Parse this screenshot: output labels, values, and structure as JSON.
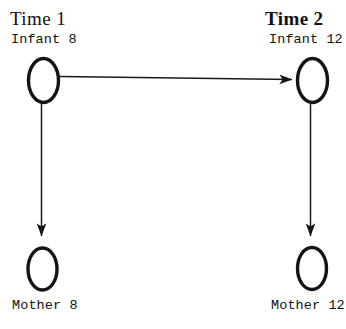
{
  "diagram": {
    "type": "path-diagram",
    "background_color": "#ffffff",
    "stroke_color": "#141414",
    "columns": [
      {
        "id": "time1",
        "title": "Time 1",
        "nodes": [
          {
            "id": "infant8",
            "label": "Infant 8",
            "label_position": "above",
            "shape": "ellipse"
          },
          {
            "id": "mother8",
            "label": "Mother 8",
            "label_position": "below",
            "shape": "ellipse"
          }
        ]
      },
      {
        "id": "time2",
        "title": "Time 2",
        "nodes": [
          {
            "id": "infant12",
            "label": "Infant 12",
            "label_position": "above",
            "shape": "ellipse"
          },
          {
            "id": "mother12",
            "label": "Mother 12",
            "label_position": "below",
            "shape": "ellipse"
          }
        ]
      }
    ],
    "edges": [
      {
        "id": "infant8-to-infant12",
        "from": "infant8",
        "to": "infant12",
        "direction": "right",
        "arrowhead": true
      },
      {
        "id": "infant8-to-mother8",
        "from": "infant8",
        "to": "mother8",
        "direction": "down",
        "arrowhead": true
      },
      {
        "id": "infant12-to-mother12",
        "from": "infant12",
        "to": "mother12",
        "direction": "down",
        "arrowhead": true
      }
    ]
  }
}
